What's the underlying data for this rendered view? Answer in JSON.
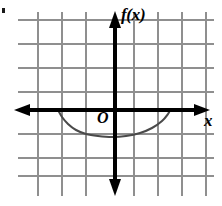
{
  "figure": {
    "background_color": "#ffffff",
    "grid_color": "#8c8c8c",
    "axis_color": "#000000",
    "curve_color": "#3a3a3a",
    "width": 222,
    "height": 206
  },
  "labels": {
    "function_label": "f(x)",
    "origin_label": "O",
    "x_axis_label": "x"
  },
  "chart_data": {
    "type": "line",
    "title": "f(x)",
    "xlabel": "x",
    "ylabel": "f(x)",
    "grid": true,
    "legend": false,
    "axis_style": "double-arrow",
    "origin_pixel": [
      115,
      110
    ],
    "grid_spacing_px": 24,
    "grid_x_lines": [
      38,
      62,
      86,
      110,
      134,
      158,
      182,
      206
    ],
    "grid_y_lines": [
      20,
      44,
      68,
      92,
      110,
      134,
      158,
      176
    ],
    "xlim": [
      -4,
      4
    ],
    "ylim": [
      -3,
      4
    ],
    "curve": {
      "name": "f(x)",
      "shape": "semicircle-lower-half",
      "x_intercepts": [
        -2.4,
        2.3
      ],
      "vertex": [
        0,
        -1.1
      ],
      "points_px": [
        [
          58,
          110
        ],
        [
          62,
          117
        ],
        [
          68,
          124
        ],
        [
          76,
          130
        ],
        [
          86,
          134
        ],
        [
          98,
          136
        ],
        [
          112,
          137
        ],
        [
          126,
          136
        ],
        [
          140,
          133
        ],
        [
          152,
          128
        ],
        [
          162,
          121
        ],
        [
          168,
          114
        ],
        [
          170,
          110
        ]
      ]
    }
  }
}
